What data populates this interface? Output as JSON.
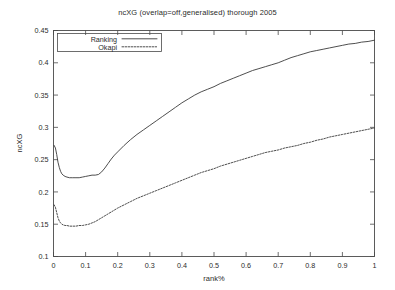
{
  "chart_data": {
    "type": "line",
    "title": "ncXG (overlap=off,generalised) thorough 2005",
    "xlabel": "rank%",
    "ylabel": "ncXG",
    "xlim": [
      0,
      1
    ],
    "ylim": [
      0.1,
      0.45
    ],
    "grid": false,
    "legend_position": "top-left-inside",
    "xticks": [
      0,
      0.1,
      0.2,
      0.3,
      0.4,
      0.5,
      0.6,
      0.7,
      0.8,
      0.9,
      1
    ],
    "xtick_labels": [
      "0",
      "0.1",
      "0.2",
      "0.3",
      "0.4",
      "0.5",
      "0.6",
      "0.7",
      "0.8",
      "0.9",
      "1"
    ],
    "yticks": [
      0.1,
      0.15,
      0.2,
      0.25,
      0.3,
      0.35,
      0.4,
      0.45
    ],
    "ytick_labels": [
      "0.1",
      "0.15",
      "0.2",
      "0.25",
      "0.3",
      "0.35",
      "0.4",
      "0.45"
    ],
    "series": [
      {
        "name": "Ranking",
        "style": "solid",
        "color": "#3a3a3a",
        "x": [
          0.002,
          0.006,
          0.01,
          0.014,
          0.018,
          0.022,
          0.026,
          0.03,
          0.036,
          0.042,
          0.05,
          0.06,
          0.07,
          0.08,
          0.09,
          0.1,
          0.11,
          0.12,
          0.13,
          0.14,
          0.15,
          0.16,
          0.17,
          0.18,
          0.19,
          0.2,
          0.22,
          0.24,
          0.26,
          0.28,
          0.3,
          0.32,
          0.34,
          0.36,
          0.38,
          0.4,
          0.42,
          0.44,
          0.46,
          0.48,
          0.5,
          0.52,
          0.54,
          0.56,
          0.58,
          0.6,
          0.62,
          0.64,
          0.66,
          0.68,
          0.7,
          0.72,
          0.74,
          0.76,
          0.78,
          0.8,
          0.82,
          0.84,
          0.86,
          0.88,
          0.9,
          0.92,
          0.94,
          0.96,
          0.98,
          1.0
        ],
        "y": [
          0.272,
          0.268,
          0.258,
          0.246,
          0.238,
          0.232,
          0.228,
          0.226,
          0.224,
          0.223,
          0.222,
          0.222,
          0.222,
          0.222,
          0.223,
          0.224,
          0.225,
          0.226,
          0.226,
          0.227,
          0.231,
          0.237,
          0.244,
          0.251,
          0.257,
          0.262,
          0.272,
          0.281,
          0.289,
          0.296,
          0.303,
          0.31,
          0.317,
          0.324,
          0.331,
          0.338,
          0.344,
          0.35,
          0.355,
          0.359,
          0.363,
          0.368,
          0.372,
          0.376,
          0.38,
          0.384,
          0.388,
          0.391,
          0.394,
          0.397,
          0.4,
          0.404,
          0.408,
          0.411,
          0.414,
          0.417,
          0.419,
          0.421,
          0.423,
          0.425,
          0.427,
          0.429,
          0.43,
          0.432,
          0.433,
          0.435
        ]
      },
      {
        "name": "Okapi",
        "style": "dotted",
        "color": "#3a3a3a",
        "x": [
          0.002,
          0.006,
          0.01,
          0.014,
          0.018,
          0.022,
          0.026,
          0.03,
          0.036,
          0.042,
          0.05,
          0.06,
          0.07,
          0.08,
          0.09,
          0.1,
          0.11,
          0.12,
          0.13,
          0.14,
          0.15,
          0.16,
          0.17,
          0.18,
          0.19,
          0.2,
          0.22,
          0.24,
          0.26,
          0.28,
          0.3,
          0.32,
          0.34,
          0.36,
          0.38,
          0.4,
          0.42,
          0.44,
          0.46,
          0.48,
          0.5,
          0.52,
          0.54,
          0.56,
          0.58,
          0.6,
          0.62,
          0.64,
          0.66,
          0.68,
          0.7,
          0.72,
          0.74,
          0.76,
          0.78,
          0.8,
          0.82,
          0.84,
          0.86,
          0.88,
          0.9,
          0.92,
          0.94,
          0.96,
          0.98,
          1.0
        ],
        "y": [
          0.18,
          0.176,
          0.168,
          0.16,
          0.155,
          0.152,
          0.15,
          0.149,
          0.148,
          0.148,
          0.147,
          0.147,
          0.147,
          0.148,
          0.148,
          0.149,
          0.15,
          0.152,
          0.154,
          0.157,
          0.16,
          0.163,
          0.166,
          0.169,
          0.172,
          0.175,
          0.18,
          0.185,
          0.19,
          0.194,
          0.198,
          0.202,
          0.206,
          0.21,
          0.214,
          0.218,
          0.222,
          0.226,
          0.23,
          0.233,
          0.236,
          0.24,
          0.243,
          0.246,
          0.249,
          0.252,
          0.255,
          0.258,
          0.261,
          0.263,
          0.265,
          0.268,
          0.27,
          0.272,
          0.275,
          0.277,
          0.28,
          0.282,
          0.285,
          0.287,
          0.289,
          0.291,
          0.293,
          0.295,
          0.297,
          0.299
        ]
      }
    ]
  }
}
